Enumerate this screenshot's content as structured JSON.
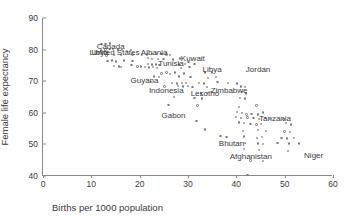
{
  "chart_data": {
    "type": "scatter",
    "title": "",
    "xlabel": "Births per 1000 population",
    "ylabel": "Female life expectancy",
    "xlim": [
      0,
      60
    ],
    "ylim": [
      40,
      90
    ],
    "xticks": [
      0,
      10,
      20,
      30,
      40,
      50,
      60
    ],
    "yticks": [
      40,
      50,
      60,
      70,
      80,
      90
    ],
    "grid": false,
    "legend": null,
    "marker": "open-circle",
    "marker_color": "#7a7a7a",
    "annotations": [
      {
        "label": "Canada",
        "x": 14.0,
        "y": 81.0
      },
      {
        "label": "United States",
        "x": 15.0,
        "y": 79.3
      },
      {
        "label": "Libya",
        "x": 11.6,
        "y": 79.3
      },
      {
        "label": "Albania",
        "x": 23.0,
        "y": 79.2
      },
      {
        "label": "Tunisia",
        "x": 26.5,
        "y": 75.8
      },
      {
        "label": "Kuwait",
        "x": 31.0,
        "y": 77.5
      },
      {
        "label": "Libya",
        "x": 35.0,
        "y": 73.8
      },
      {
        "label": "Jordan",
        "x": 44.5,
        "y": 74.0
      },
      {
        "label": "Guyana",
        "x": 21.0,
        "y": 70.5
      },
      {
        "label": "Indonesia",
        "x": 25.5,
        "y": 67.3
      },
      {
        "label": "Lesotho",
        "x": 33.5,
        "y": 66.3
      },
      {
        "label": "Zimbabwe",
        "x": 38.5,
        "y": 67.3
      },
      {
        "label": "Gabon",
        "x": 27.0,
        "y": 59.3
      },
      {
        "label": "Tanzania",
        "x": 48.0,
        "y": 58.5
      },
      {
        "label": "Bhutan",
        "x": 39.0,
        "y": 50.5
      },
      {
        "label": "Afghanistan",
        "x": 43.0,
        "y": 46.3
      },
      {
        "label": "Niger",
        "x": 56.0,
        "y": 46.5
      }
    ],
    "points": [
      {
        "x": 12.2,
        "y": 81.6
      },
      {
        "x": 13.0,
        "y": 81.6
      },
      {
        "x": 13.9,
        "y": 81.8
      },
      {
        "x": 12.0,
        "y": 79.6
      },
      {
        "x": 13.0,
        "y": 79.9
      },
      {
        "x": 13.8,
        "y": 80.1
      },
      {
        "x": 14.6,
        "y": 80.0
      },
      {
        "x": 15.6,
        "y": 79.9
      },
      {
        "x": 16.4,
        "y": 79.8
      },
      {
        "x": 17.4,
        "y": 79.5
      },
      {
        "x": 18.3,
        "y": 79.8
      },
      {
        "x": 13.2,
        "y": 78.0
      },
      {
        "x": 14.8,
        "y": 78.2
      },
      {
        "x": 16.2,
        "y": 78.1
      },
      {
        "x": 18.6,
        "y": 78.3
      },
      {
        "x": 20.6,
        "y": 78.2
      },
      {
        "x": 13.4,
        "y": 76.2
      },
      {
        "x": 14.4,
        "y": 76.4
      },
      {
        "x": 15.2,
        "y": 76.1
      },
      {
        "x": 16.8,
        "y": 76.5
      },
      {
        "x": 18.6,
        "y": 76.3
      },
      {
        "x": 14.8,
        "y": 74.8
      },
      {
        "x": 15.8,
        "y": 74.6
      },
      {
        "x": 16.2,
        "y": 74.4
      },
      {
        "x": 18.4,
        "y": 75.0
      },
      {
        "x": 21.6,
        "y": 78.4
      },
      {
        "x": 22.6,
        "y": 78.5
      },
      {
        "x": 23.4,
        "y": 78.5
      },
      {
        "x": 24.6,
        "y": 78.6
      },
      {
        "x": 25.6,
        "y": 78.4
      },
      {
        "x": 26.4,
        "y": 78.1
      },
      {
        "x": 21.8,
        "y": 77.2
      },
      {
        "x": 22.6,
        "y": 77.0
      },
      {
        "x": 23.8,
        "y": 77.0
      },
      {
        "x": 25.0,
        "y": 76.9
      },
      {
        "x": 27.0,
        "y": 76.8
      },
      {
        "x": 28.4,
        "y": 77.1
      },
      {
        "x": 21.8,
        "y": 75.4
      },
      {
        "x": 22.6,
        "y": 75.2
      },
      {
        "x": 23.4,
        "y": 75.2
      },
      {
        "x": 24.2,
        "y": 75.0
      },
      {
        "x": 28.2,
        "y": 75.2
      },
      {
        "x": 29.4,
        "y": 75.4
      },
      {
        "x": 30.2,
        "y": 76.0
      },
      {
        "x": 19.6,
        "y": 74.6
      },
      {
        "x": 20.4,
        "y": 74.6
      },
      {
        "x": 21.2,
        "y": 74.4
      },
      {
        "x": 22.0,
        "y": 74.2
      },
      {
        "x": 22.8,
        "y": 74.4
      },
      {
        "x": 23.6,
        "y": 74.0
      },
      {
        "x": 28.6,
        "y": 74.0
      },
      {
        "x": 30.4,
        "y": 74.4
      },
      {
        "x": 31.4,
        "y": 75.4
      },
      {
        "x": 24.6,
        "y": 72.4
      },
      {
        "x": 25.6,
        "y": 72.6
      },
      {
        "x": 26.4,
        "y": 72.2
      },
      {
        "x": 27.4,
        "y": 72.6
      },
      {
        "x": 29.2,
        "y": 72.4
      },
      {
        "x": 33.6,
        "y": 72.6
      },
      {
        "x": 35.0,
        "y": 72.6
      },
      {
        "x": 23.0,
        "y": 71.4
      },
      {
        "x": 24.0,
        "y": 71.2
      },
      {
        "x": 28.2,
        "y": 71.4
      },
      {
        "x": 30.6,
        "y": 71.2
      },
      {
        "x": 34.2,
        "y": 71.0
      },
      {
        "x": 35.8,
        "y": 71.2
      },
      {
        "x": 22.4,
        "y": 69.6
      },
      {
        "x": 26.8,
        "y": 69.4
      },
      {
        "x": 27.8,
        "y": 69.2
      },
      {
        "x": 28.8,
        "y": 69.4
      },
      {
        "x": 29.6,
        "y": 69.3
      },
      {
        "x": 32.4,
        "y": 69.4
      },
      {
        "x": 33.4,
        "y": 69.2
      },
      {
        "x": 36.2,
        "y": 69.6
      },
      {
        "x": 38.4,
        "y": 69.4
      },
      {
        "x": 40.2,
        "y": 69.2
      },
      {
        "x": 25.2,
        "y": 68.2
      },
      {
        "x": 28.0,
        "y": 68.4
      },
      {
        "x": 29.0,
        "y": 68.2
      },
      {
        "x": 30.0,
        "y": 68.4
      },
      {
        "x": 31.0,
        "y": 68.0
      },
      {
        "x": 34.0,
        "y": 68.1
      },
      {
        "x": 41.0,
        "y": 68.2
      },
      {
        "x": 41.8,
        "y": 68.0
      },
      {
        "x": 32.8,
        "y": 66.0
      },
      {
        "x": 34.0,
        "y": 66.2
      },
      {
        "x": 41.2,
        "y": 66.4
      },
      {
        "x": 42.0,
        "y": 66.0
      },
      {
        "x": 27.2,
        "y": 65.0
      },
      {
        "x": 31.4,
        "y": 64.6
      },
      {
        "x": 33.0,
        "y": 64.4
      },
      {
        "x": 40.8,
        "y": 64.6
      },
      {
        "x": 41.8,
        "y": 64.4
      },
      {
        "x": 26.0,
        "y": 62.4
      },
      {
        "x": 32.0,
        "y": 62.2
      },
      {
        "x": 40.6,
        "y": 61.8
      },
      {
        "x": 44.2,
        "y": 62.2
      },
      {
        "x": 40.2,
        "y": 60.2
      },
      {
        "x": 41.2,
        "y": 59.8
      },
      {
        "x": 42.2,
        "y": 59.4
      },
      {
        "x": 43.2,
        "y": 59.6
      },
      {
        "x": 44.6,
        "y": 59.4
      },
      {
        "x": 45.6,
        "y": 60.0
      },
      {
        "x": 40.0,
        "y": 58.6
      },
      {
        "x": 41.0,
        "y": 58.3
      },
      {
        "x": 42.4,
        "y": 58.4
      },
      {
        "x": 43.6,
        "y": 58.2
      },
      {
        "x": 44.8,
        "y": 58.0
      },
      {
        "x": 46.0,
        "y": 58.2
      },
      {
        "x": 47.0,
        "y": 58.0
      },
      {
        "x": 49.8,
        "y": 57.8
      },
      {
        "x": 31.8,
        "y": 57.4
      },
      {
        "x": 40.6,
        "y": 56.8
      },
      {
        "x": 41.6,
        "y": 56.6
      },
      {
        "x": 43.0,
        "y": 56.4
      },
      {
        "x": 44.2,
        "y": 56.2
      },
      {
        "x": 45.2,
        "y": 56.4
      },
      {
        "x": 50.4,
        "y": 56.6
      },
      {
        "x": 51.4,
        "y": 56.2
      },
      {
        "x": 33.6,
        "y": 54.6
      },
      {
        "x": 41.4,
        "y": 54.2
      },
      {
        "x": 44.6,
        "y": 54.4
      },
      {
        "x": 46.2,
        "y": 54.2
      },
      {
        "x": 50.0,
        "y": 54.0
      },
      {
        "x": 51.2,
        "y": 53.8
      },
      {
        "x": 36.8,
        "y": 52.6
      },
      {
        "x": 38.0,
        "y": 52.2
      },
      {
        "x": 41.6,
        "y": 52.4
      },
      {
        "x": 44.4,
        "y": 52.0
      },
      {
        "x": 45.4,
        "y": 52.2
      },
      {
        "x": 49.4,
        "y": 52.0
      },
      {
        "x": 50.6,
        "y": 51.8
      },
      {
        "x": 52.0,
        "y": 52.0
      },
      {
        "x": 41.8,
        "y": 50.4
      },
      {
        "x": 44.6,
        "y": 50.2
      },
      {
        "x": 45.6,
        "y": 50.0
      },
      {
        "x": 48.6,
        "y": 50.4
      },
      {
        "x": 51.0,
        "y": 50.2
      },
      {
        "x": 53.0,
        "y": 50.2
      },
      {
        "x": 41.6,
        "y": 48.4
      },
      {
        "x": 44.8,
        "y": 48.2
      },
      {
        "x": 50.8,
        "y": 47.8
      },
      {
        "x": 43.0,
        "y": 44.8
      },
      {
        "x": 45.6,
        "y": 44.6
      },
      {
        "x": 42.4,
        "y": 40.2
      }
    ]
  }
}
